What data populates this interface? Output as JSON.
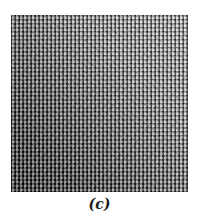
{
  "figure": {
    "caption": "(c)",
    "panel": {
      "description": "halftone dithered texture, dark bottom-left to light top-right",
      "colors": {
        "dark": "#111111",
        "light": "#c8c8c8"
      }
    }
  }
}
